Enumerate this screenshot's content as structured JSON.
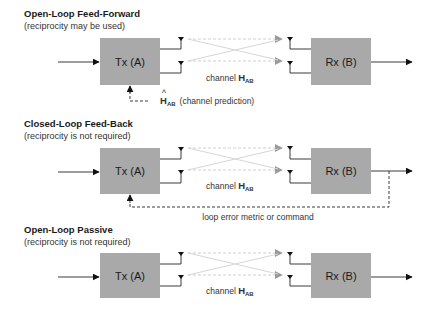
{
  "colors": {
    "block_fill": "#a9a9a9",
    "wire": "#3a3a3a",
    "channel_lines": "#cfcfcf",
    "channel_arrowheads": "#9a9a9a"
  },
  "sections": [
    {
      "title": "Open-Loop Feed-Forward",
      "subtitle": "(reciprocity may be used)",
      "tx_label": "Tx (A)",
      "rx_label": "Rx (B)",
      "channel_prefix": "channel ",
      "channel_symbol": "H",
      "channel_subscript": "AB",
      "feedback": {
        "type": "channel-prediction",
        "hat": "^",
        "symbol": "H",
        "subscript": "AB",
        "text": "(channel prediction)"
      }
    },
    {
      "title": "Closed-Loop Feed-Back",
      "subtitle": "(reciprocity is not required)",
      "tx_label": "Tx (A)",
      "rx_label": "Rx (B)",
      "channel_prefix": "channel ",
      "channel_symbol": "H",
      "channel_subscript": "AB",
      "feedback": {
        "type": "loop",
        "text": "loop error metric or command"
      }
    },
    {
      "title": "Open-Loop Passive",
      "subtitle": "(reciprocity is not required)",
      "tx_label": "Tx (A)",
      "rx_label": "Rx (B)",
      "channel_prefix": "channel ",
      "channel_symbol": "H",
      "channel_subscript": "AB"
    }
  ]
}
